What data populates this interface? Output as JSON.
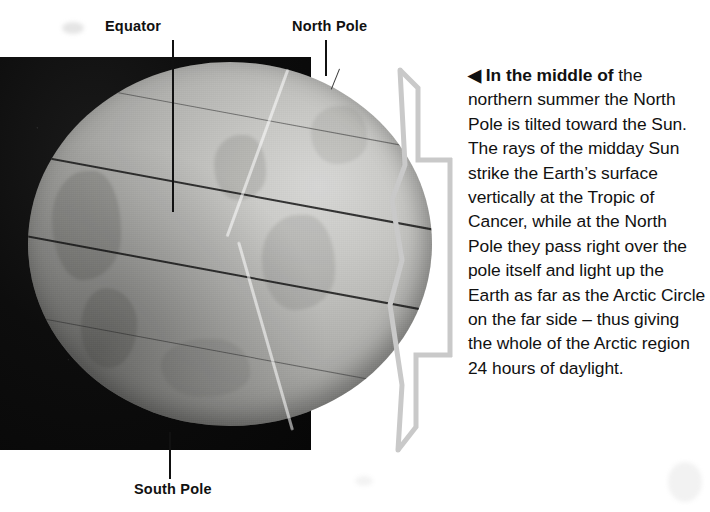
{
  "figure": {
    "labels": [
      {
        "id": "equator",
        "text": "Equator"
      },
      {
        "id": "north-pole",
        "text": "North Pole"
      },
      {
        "id": "south-pole",
        "text": "South Pole"
      }
    ],
    "caption": {
      "arrow": "◀",
      "lead": "In the middle of",
      "body": "the northern summer the North Pole is tilted toward the Sun. The rays of the midday Sun strike the Earth’s surface vertically at the Tropic of Cancer, while at the North Pole they pass right over the pole itself and light up the Earth as far as the Arctic Circle on the far side – thus giving the whole of the Arctic region 24 hours of daylight."
    },
    "colors": {
      "page_background": "#ffffff",
      "space_background": "#0d0d0d",
      "globe_light": "#d8d8d6",
      "globe_dark": "#4a4a47",
      "bracket": "#c9c9c9",
      "text": "#111111",
      "leader_line": "#111111"
    }
  }
}
